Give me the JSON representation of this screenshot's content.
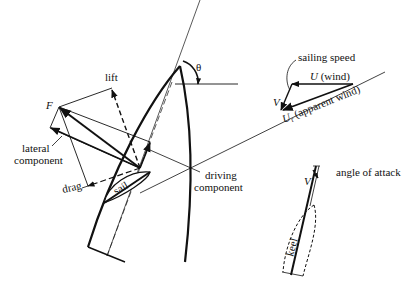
{
  "diagram": {
    "labels": {
      "lift": "lift",
      "force": "F",
      "lateral_line1": "lateral",
      "lateral_line2": "component",
      "drag": "drag",
      "sail": "sail",
      "driving_line1": "driving",
      "driving_line2": "component",
      "theta": "θ",
      "sailing_speed": "sailing speed",
      "wind_symbol": "U",
      "wind_text": "(wind)",
      "velocity": "V",
      "apparent_symbol": "U",
      "apparent_sub": "r",
      "apparent_text": "(apparent wind)",
      "keel_velocity": "V",
      "angle_of_attack": "angle of attack",
      "keel": "keel"
    },
    "colors": {
      "ink": "#111111",
      "background": "#ffffff"
    }
  }
}
